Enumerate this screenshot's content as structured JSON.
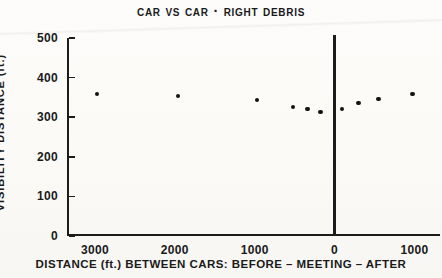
{
  "chart_data": {
    "type": "scatter",
    "title": "Car vs Car · Right Debris",
    "xlabel": "DISTANCE (ft.) BETWEEN CARS:  BEFORE – MEETING – AFTER",
    "ylabel": "VISIBILITY DISTANCE (ft.)",
    "ylim": [
      0,
      500
    ],
    "yticks": [
      0,
      100,
      200,
      300,
      400,
      500
    ],
    "ytick_labels": [
      "0",
      "100",
      "200",
      "300",
      "400",
      "500"
    ],
    "xtick_labels": [
      "3000",
      "2000",
      "1000",
      "0",
      "1000"
    ],
    "xtick_positions": [
      -3000,
      -2000,
      -1000,
      0,
      1000
    ],
    "xlim": [
      -3350,
      1320
    ],
    "grid": false,
    "legend": null,
    "annotations": [
      {
        "name": "meeting-line",
        "x": 0,
        "description": "vertical reference line at meeting point"
      }
    ],
    "series": [
      {
        "name": "Right debris visibility",
        "marker": "filled-circle",
        "color": "#141414",
        "points": [
          {
            "x": -2975,
            "y": 358
          },
          {
            "x": -1963,
            "y": 353
          },
          {
            "x": -975,
            "y": 343
          },
          {
            "x": -525,
            "y": 325
          },
          {
            "x": -338,
            "y": 320
          },
          {
            "x": -175,
            "y": 313
          },
          {
            "x": 88,
            "y": 320
          },
          {
            "x": 300,
            "y": 335
          },
          {
            "x": 550,
            "y": 345
          },
          {
            "x": 975,
            "y": 358
          }
        ]
      }
    ]
  }
}
